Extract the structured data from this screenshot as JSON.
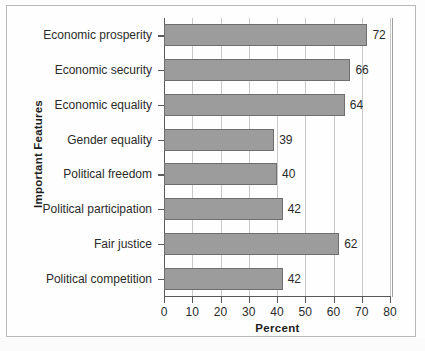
{
  "chart_data": {
    "type": "bar",
    "orientation": "horizontal",
    "title": "",
    "xlabel": "Percent",
    "ylabel": "Important Features",
    "xlim": [
      0,
      80
    ],
    "xticks": [
      0,
      10,
      20,
      30,
      40,
      50,
      60,
      70,
      80
    ],
    "grid": "vertical",
    "legend": "none",
    "categories": [
      "Economic prosperity",
      "Economic security",
      "Economic equality",
      "Gender equality",
      "Political freedom",
      "Political participation",
      "Fair justice",
      "Political competition"
    ],
    "values": [
      72,
      66,
      64,
      39,
      40,
      42,
      62,
      42
    ],
    "data_labels": [
      "72",
      "66",
      "64",
      "39",
      "40",
      "42",
      "62",
      "42"
    ],
    "colors": {
      "bar_fill": "#9c9c9c",
      "bar_border": "#6e6e6e",
      "gridline": "#c9c9c9",
      "axis": "#5a5a5a",
      "text": "#2b2b2b",
      "background": "#fdfdfd",
      "frame": "#b9b9b9"
    }
  }
}
